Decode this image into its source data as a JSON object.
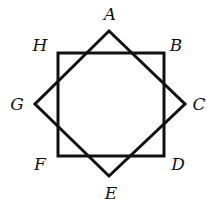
{
  "diagram": {
    "square": {
      "name": "square HBDF",
      "points": [
        [
          58,
          53
        ],
        [
          164,
          53
        ],
        [
          164,
          156
        ],
        [
          58,
          156
        ]
      ]
    },
    "diamond": {
      "name": "square ACEG (rotated 45°)",
      "points": [
        [
          109,
          31
        ],
        [
          185,
          104
        ],
        [
          109,
          176
        ],
        [
          35,
          104
        ]
      ]
    },
    "labels": [
      {
        "text": "A",
        "x": 110,
        "y": 20
      },
      {
        "text": "B",
        "x": 176,
        "y": 51
      },
      {
        "text": "C",
        "x": 199,
        "y": 110
      },
      {
        "text": "D",
        "x": 178,
        "y": 170
      },
      {
        "text": "E",
        "x": 111,
        "y": 199
      },
      {
        "text": "F",
        "x": 40,
        "y": 170
      },
      {
        "text": "G",
        "x": 17,
        "y": 110
      },
      {
        "text": "H",
        "x": 40,
        "y": 51
      }
    ],
    "stroke_color": "#111111"
  }
}
